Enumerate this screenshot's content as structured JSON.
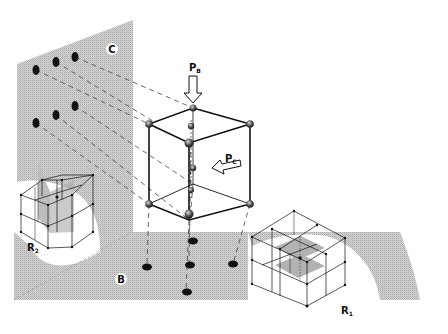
{
  "figure": {
    "type": "crystal-lattice-projection-diagram",
    "colors": {
      "background": "#ffffff",
      "plane_shade": "#c9c9c9",
      "ink": "#111111"
    }
  },
  "planes": {
    "vertical_plane": {
      "label": "C"
    },
    "floor_plane": {
      "label": "B"
    }
  },
  "pressures": {
    "p_b": {
      "main": "P",
      "sub": "B"
    },
    "p_c": {
      "main": "P",
      "sub": "C"
    }
  },
  "lattices": {
    "r1": {
      "main": "R",
      "sub": "1"
    },
    "r2": {
      "main": "R",
      "sub": "2"
    }
  },
  "projected_points": {
    "on_plane_c": 6,
    "on_plane_b": 5
  }
}
